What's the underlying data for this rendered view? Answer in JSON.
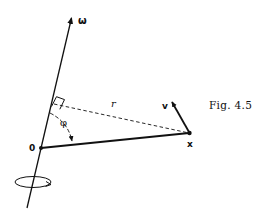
{
  "figure": {
    "caption": "Fig. 4.5",
    "labels": {
      "omega": "ω",
      "origin": "0",
      "point": "x",
      "velocity": "v",
      "radius": "r",
      "angle": "φ"
    },
    "colors": {
      "stroke": "#111111",
      "background": "#ffffff"
    }
  }
}
